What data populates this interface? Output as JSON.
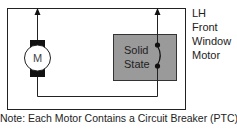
{
  "diagram": {
    "motor_symbol": "M",
    "switch_label_line1": "Solid",
    "switch_label_line2": "State",
    "side_label": [
      "LH",
      "Front",
      "Window",
      "Motor"
    ],
    "note": "Note: Each Motor Contains a Circuit Breaker (PTC).",
    "colors": {
      "line": "#222222",
      "switch_box": "#999999",
      "motor_block": "#111111"
    }
  }
}
